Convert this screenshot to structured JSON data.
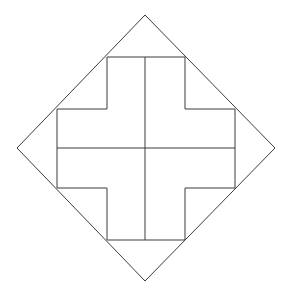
{
  "figure": {
    "type": "geometric-diagram",
    "canvas": {
      "width": 291,
      "height": 297
    },
    "background_color": "#ffffff",
    "stroke_color": "#3c3c3c",
    "stroke_width": 1,
    "shapes": {
      "diamond": {
        "name": "rotated-square",
        "label": "Diamond",
        "vertices": [
          {
            "label": "top",
            "x": 145,
            "y": 15
          },
          {
            "label": "right",
            "x": 275,
            "y": 148
          },
          {
            "label": "bottom",
            "x": 145,
            "y": 281
          },
          {
            "label": "left",
            "x": 17,
            "y": 148
          }
        ]
      },
      "cross": {
        "name": "plus-shape",
        "label": "Cross",
        "vertical_arm": {
          "left": 107,
          "right": 185,
          "top": 57,
          "bottom": 240
        },
        "horizontal_arm": {
          "top": 109,
          "bottom": 188,
          "left": 57,
          "right": 235
        },
        "outline_points": "107,57 185,57 185,109 235,109 235,188 185,188 185,240 107,240 107,188 57,188 57,109 107,109"
      }
    },
    "grid_lines": {
      "label": "Internal grid lines",
      "vertical": [
        {
          "name": "center-vertical",
          "x": 145,
          "y1": 57,
          "y2": 240
        }
      ],
      "horizontal": [
        {
          "name": "center-horizontal",
          "y": 148,
          "x1": 57,
          "x2": 235
        }
      ]
    },
    "grid_divisions": {
      "columns": 3,
      "rows": 3
    }
  }
}
